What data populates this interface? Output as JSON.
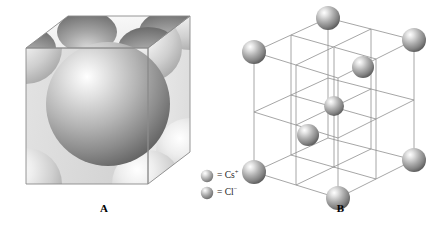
{
  "figure": {
    "background_color": "#ffffff"
  },
  "panels": [
    {
      "id": "A",
      "label": "A",
      "caption": "Space-filling unit cell model",
      "type": "space-filling-cube",
      "description": "Cube with one large central sphere and eight corner spheres truncated by the cube faces",
      "central_sphere": {
        "ion": "Cl-",
        "radius": 62,
        "center": [
          100,
          100
        ]
      },
      "corner_spheres": 8,
      "colors": {
        "cube_top_face": "#f2f2f2",
        "cube_left_face": "#dcdcdc",
        "cube_right_face": "#e8e8e8",
        "cube_edge": "#9a9a9a",
        "sphere_light": "#ffffff",
        "sphere_mid": "#b8b8b8",
        "sphere_dark": "#6e6e6e",
        "corner_sphere_light": "#fcfcfc",
        "corner_sphere_mid": "#d5d5d5",
        "corner_sphere_dark": "#9c9c9c"
      }
    },
    {
      "id": "B",
      "label": "B",
      "caption": "Expanded wireframe lattice model",
      "type": "wireframe-lattice",
      "description": "2x2x2 subdivided cubic wireframe with ions at corners and interior body-center positions",
      "grid_divisions": 2,
      "corner_ion_count": 8,
      "interior_ion_count": 4,
      "colors": {
        "wire": "#8c8c8c",
        "sphere_light": "#f4f4f4",
        "sphere_mid": "#a8a8a8",
        "sphere_dark": "#5e5e5e"
      }
    }
  ],
  "legend": {
    "items": [
      {
        "icon": "sphere-cesium",
        "equals": "=",
        "formula": "Cs",
        "charge": "+",
        "full_text": "= Cs+",
        "color": "#a8a8a8"
      },
      {
        "icon": "sphere-chloride",
        "equals": "=",
        "formula": "Cl",
        "charge": "−",
        "full_text": "= Cl−",
        "color": "#9e9e9e"
      }
    ]
  }
}
